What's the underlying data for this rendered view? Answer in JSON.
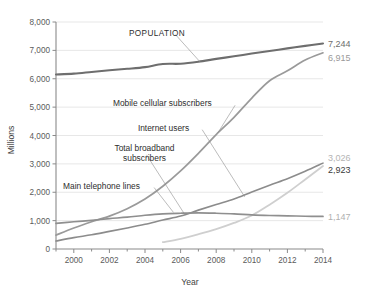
{
  "chart_data": {
    "type": "line",
    "title": "",
    "xlabel": "Year",
    "ylabel": "Millions",
    "xlim": [
      1999,
      2014
    ],
    "ylim": [
      0,
      8000
    ],
    "grid": true,
    "legend_position": "inline-annotations",
    "x": [
      1999,
      2000,
      2001,
      2002,
      2003,
      2004,
      2005,
      2006,
      2007,
      2008,
      2009,
      2010,
      2011,
      2012,
      2013,
      2014
    ],
    "xticks": [
      "2000",
      "2002",
      "2004",
      "2006",
      "2008",
      "2010",
      "2012",
      "2014"
    ],
    "xtick_values": [
      2000,
      2002,
      2004,
      2006,
      2008,
      2010,
      2012,
      2014
    ],
    "yticks": [
      "0",
      "1,000",
      "2,000",
      "3,000",
      "4,000",
      "5,000",
      "6,000",
      "7,000",
      "8,000"
    ],
    "ytick_values": [
      0,
      1000,
      2000,
      3000,
      4000,
      5000,
      6000,
      7000,
      8000
    ],
    "series": [
      {
        "name": "POPULATION",
        "color": "#6e6e6e",
        "width": 2.1,
        "end_value": "7,244",
        "end_value_color": "#6e6e6e",
        "label_x": 2003.1,
        "label_y": 7520,
        "leader_to_x": 2007.1,
        "leader_to_y": 6590,
        "values": [
          6150,
          6180,
          6240,
          6300,
          6350,
          6410,
          6520,
          6530,
          6600,
          6700,
          6790,
          6890,
          6980,
          7070,
          7160,
          7244
        ]
      },
      {
        "name": "Mobile cellular subscribers",
        "color": "#9a9a9a",
        "width": 1.7,
        "end_value": "6,915",
        "end_value_color": "#9a9a9a",
        "label_x": 2002.2,
        "label_y": 5030,
        "leader_to_x": 2008.1,
        "leader_to_y": 4100,
        "values": [
          490,
          740,
          960,
          1160,
          1420,
          1760,
          2210,
          2750,
          3370,
          4030,
          4640,
          5320,
          5930,
          6280,
          6660,
          6915
        ]
      },
      {
        "name": "Internet users",
        "color": "#8c8c8c",
        "width": 1.6,
        "end_value": "3,026",
        "end_value_color": "#b4b4b4",
        "label_x": 2003.6,
        "label_y": 4170,
        "leader_to_x": 2009.6,
        "leader_to_y": 1840,
        "values": [
          280,
          400,
          500,
          620,
          740,
          870,
          1020,
          1160,
          1370,
          1570,
          1760,
          2010,
          2250,
          2480,
          2740,
          3026
        ]
      },
      {
        "name": "Total broadband subscribers",
        "color": "#cfcfcf",
        "width": 1.8,
        "end_value": "2,923",
        "end_value_color": "#3a3a3a",
        "label_x": 2001.5,
        "label_y": 3450,
        "leader_to_x": 2006.2,
        "leader_to_y": 1250,
        "values": [
          null,
          null,
          null,
          null,
          null,
          null,
          240,
          360,
          520,
          700,
          920,
          1180,
          1560,
          1980,
          2450,
          2923
        ]
      },
      {
        "name": "Main telephone lines",
        "color": "#8f8f8f",
        "width": 1.7,
        "end_value": "1,147",
        "end_value_color": "#b0b0b0",
        "label_x": 1999.4,
        "label_y": 2130,
        "leader_to_x": 2005.6,
        "leader_to_y": 1290,
        "values": [
          900,
          960,
          1010,
          1070,
          1120,
          1190,
          1240,
          1260,
          1270,
          1260,
          1240,
          1200,
          1180,
          1170,
          1155,
          1147
        ]
      }
    ]
  },
  "axis": {
    "x_title": "Year",
    "y_title": "Millions"
  }
}
